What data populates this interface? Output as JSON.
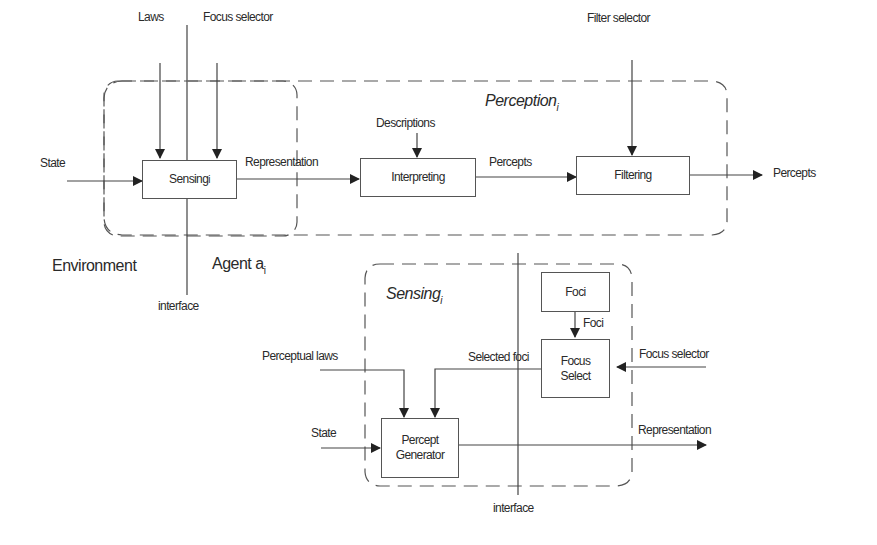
{
  "diagram": {
    "top": {
      "region_title": "Perception",
      "region_sub": "i",
      "boxes": {
        "sensing": "Sensing",
        "sensing_sub": "i",
        "interpreting": "Interpreting",
        "filtering": "Filtering"
      },
      "inputs": {
        "laws": "Laws",
        "focus_selector": "Focus selector",
        "descriptions": "Descriptions",
        "filter_selector": "Filter selector",
        "state": "State"
      },
      "edges": {
        "representation": "Representation",
        "percepts": "Percepts",
        "percepts_out": "Percepts"
      },
      "environment": "Environment",
      "agent": "Agent a",
      "agent_sub": "i",
      "interface": "interface"
    },
    "bottom": {
      "region_title": "Sensing",
      "region_sub": "i",
      "boxes": {
        "foci": "Foci",
        "focus_select_1": "Focus",
        "focus_select_2": "Select",
        "percept_gen_1": "Percept",
        "percept_gen_2": "Generator"
      },
      "labels": {
        "foci_edge": "Foci",
        "selected_foci": "Selected foci",
        "perceptual_laws": "Perceptual laws",
        "focus_selector": "Focus selector",
        "state": "State",
        "representation": "Representation",
        "interface": "interface"
      }
    }
  }
}
